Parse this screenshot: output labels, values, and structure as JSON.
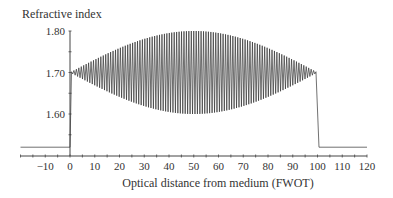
{
  "chart_data": {
    "type": "line",
    "title": "",
    "ylabel": "Refractive index",
    "xlabel": "Optical distance from medium (FWOT)",
    "xlim": [
      -20,
      120
    ],
    "ylim": [
      1.52,
      1.8
    ],
    "x_ticks": [
      -10,
      0,
      10,
      20,
      30,
      40,
      50,
      60,
      70,
      80,
      90,
      100,
      110,
      120
    ],
    "x_tick_labels": [
      "−10",
      "0",
      "10",
      "20",
      "30",
      "40",
      "50",
      "60",
      "70",
      "80",
      "90",
      "100",
      "110",
      "120"
    ],
    "y_ticks": [
      1.6,
      1.7,
      1.8
    ],
    "y_tick_labels": [
      "1.60",
      "1.70",
      "1.80"
    ],
    "grid": false,
    "legend": null,
    "series": [
      {
        "name": "refractive index profile",
        "description": "Baseline 1.52 outside medium (x<0 and x>100); inside the medium (0 to 100) the index oscillates rapidly around 1.70 with a sinusoidal envelope reaching about ±0.10 at x=50 and tapering to 0 at x=0 and x=100.",
        "baseline": 1.52,
        "mean": 1.7,
        "max_amplitude": 0.1,
        "medium_start": 0,
        "medium_end": 100,
        "oscillation_periods": 100,
        "envelope_x": [
          0,
          10,
          20,
          30,
          40,
          50,
          60,
          70,
          80,
          90,
          100
        ],
        "envelope_upper": [
          1.7,
          1.731,
          1.759,
          1.781,
          1.795,
          1.8,
          1.795,
          1.781,
          1.759,
          1.731,
          1.7
        ],
        "envelope_lower": [
          1.7,
          1.669,
          1.641,
          1.619,
          1.605,
          1.6,
          1.605,
          1.619,
          1.641,
          1.669,
          1.7
        ]
      }
    ]
  }
}
